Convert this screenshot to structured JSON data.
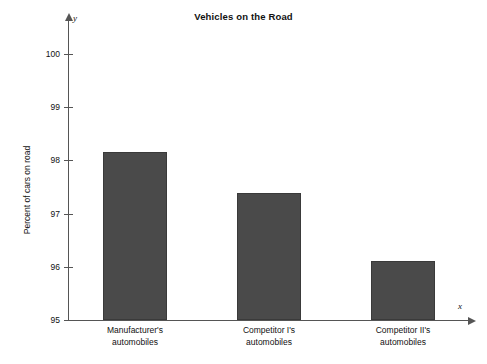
{
  "chart_data": {
    "type": "bar",
    "title": "Vehicles on the Road",
    "xlabel": "",
    "ylabel": "Percent of cars on road",
    "categories": [
      "Manufacturer's automobiles",
      "Competitor I's automobiles",
      "Competitor II's automobiles"
    ],
    "category_lines": [
      [
        "Manufacturer's",
        "automobiles"
      ],
      [
        "Competitor I's",
        "automobiles"
      ],
      [
        "Competitor II's",
        "automobiles"
      ]
    ],
    "values": [
      98.15,
      97.38,
      96.1
    ],
    "ylim": [
      95,
      100
    ],
    "yticks": [
      95,
      96,
      97,
      98,
      99,
      100
    ],
    "ytick_labels": [
      "95",
      "96",
      "97",
      "98",
      "99",
      "100"
    ],
    "grid": false,
    "legend": false,
    "axis_variables": {
      "y": "y",
      "x": "x"
    },
    "colors": {
      "bar_fill": "#4a4a4a",
      "bar_stroke": "#3a3a3a",
      "axis": "#555555",
      "text": "#111111",
      "background": "#ffffff"
    }
  }
}
